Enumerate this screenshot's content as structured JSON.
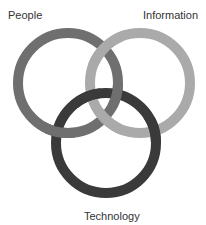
{
  "diagram": {
    "type": "three-ring interlocking diagram",
    "labels": {
      "people": "People",
      "information": "Information",
      "technology": "Technology"
    },
    "rings": [
      {
        "name": "People",
        "color": "#6f6f6f",
        "cx": 68,
        "cy": 83,
        "r": 50,
        "stroke_width": 10
      },
      {
        "name": "Information",
        "color": "#aaaaaa",
        "cx": 140,
        "cy": 83,
        "r": 50,
        "stroke_width": 10
      },
      {
        "name": "Technology",
        "color": "#3a3a3a",
        "cx": 106,
        "cy": 143,
        "r": 50,
        "stroke_width": 10
      }
    ]
  }
}
